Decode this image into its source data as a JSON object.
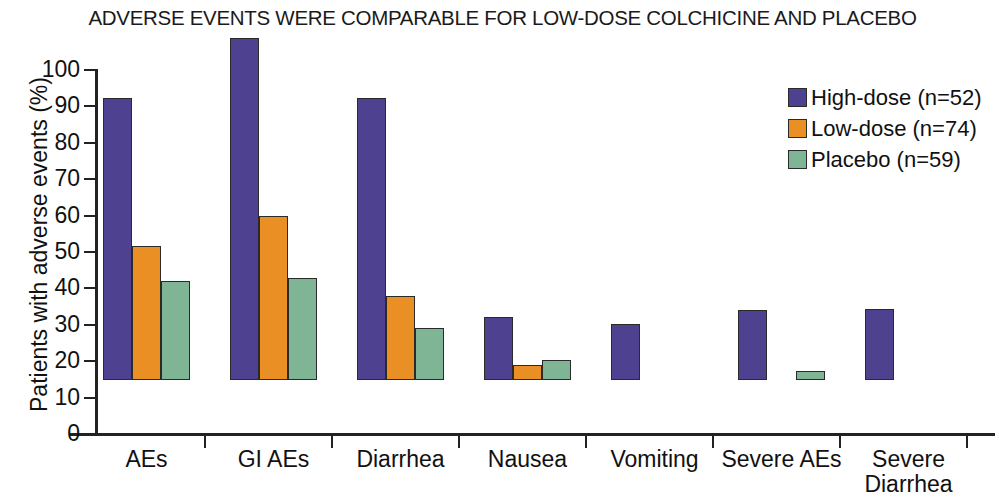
{
  "chart_data": {
    "type": "bar",
    "title": "ADVERSE EVENTS WERE COMPARABLE FOR LOW-DOSE COLCHICINE AND PLACEBO",
    "xlabel": "",
    "ylabel": "Patients with adverse events (%)",
    "ylim": [
      0,
      100
    ],
    "ytick_labels": [
      "0",
      "10",
      "20",
      "30",
      "40",
      "50",
      "60",
      "70",
      "80",
      "90",
      "100"
    ],
    "ytick_values": [
      0,
      10,
      20,
      30,
      40,
      50,
      60,
      70,
      80,
      90,
      100
    ],
    "grid": false,
    "legend_position": "top-right",
    "categories": [
      "AEs",
      "GI AEs",
      "Diarrhea",
      "Nausea",
      "Vomiting",
      "Severe AEs",
      "Severe\nDiarrhea"
    ],
    "series": [
      {
        "name": "High-dose (n=52)",
        "color": "#4e4290",
        "values": [
          77.5,
          94.0,
          77.5,
          17.2,
          15.3,
          19.2,
          19.5
        ]
      },
      {
        "name": "Low-dose (n=74)",
        "color": "#ea8f23",
        "values": [
          36.7,
          45.0,
          23.0,
          4.1,
          0,
          0,
          0
        ]
      },
      {
        "name": "Placebo (n=59)",
        "color": "#7fb494",
        "values": [
          27.1,
          27.9,
          14.2,
          5.4,
          0,
          2.5,
          0
        ]
      }
    ]
  },
  "legend": {
    "items": [
      {
        "label": "High-dose (n=52)",
        "color": "#4e4290"
      },
      {
        "label": "Low-dose (n=74)",
        "color": "#ea8f23"
      },
      {
        "label": "Placebo (n=59)",
        "color": "#7fb494"
      }
    ]
  }
}
